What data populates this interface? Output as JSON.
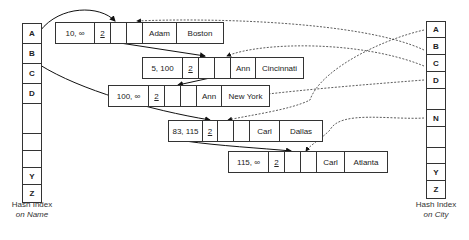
{
  "name_index": {
    "cells": [
      "A",
      "B",
      "C",
      "D",
      "",
      "",
      "",
      "",
      "Y",
      "Z"
    ],
    "caption_line1": "Hash Index",
    "caption_line2": "on Name"
  },
  "city_index": {
    "cells": [
      "A",
      "B",
      "C",
      "D",
      "",
      "N",
      "",
      "",
      "Y",
      "Z"
    ],
    "caption_line1": "Hash Index",
    "caption_line2": "on City"
  },
  "records": [
    {
      "interval": "10, ∞",
      "version": "2",
      "name": "Adam",
      "city": "Boston"
    },
    {
      "interval": "5, 100",
      "version": "2",
      "name": "Ann",
      "city": "Cincinnati"
    },
    {
      "interval": "100, ∞",
      "version": "2",
      "name": "Ann",
      "city": "New York"
    },
    {
      "interval": "83, 115",
      "version": "2",
      "name": "Carl",
      "city": "Dallas"
    },
    {
      "interval": "115, ∞",
      "version": "2",
      "name": "Carl",
      "city": "Atlanta"
    }
  ]
}
